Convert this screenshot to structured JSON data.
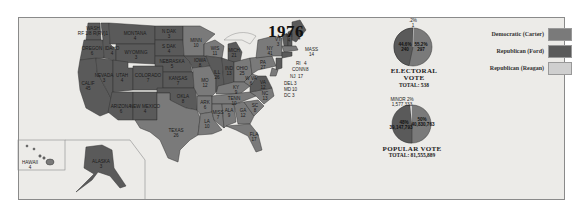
{
  "title": "1976",
  "colors": {
    "democratic_carter": "#7a7a7a",
    "republican_ford": "#5a5a5a",
    "republican_reagan": "#cfcfcf",
    "background": "#ecebe8",
    "border": "#8a8a8a"
  },
  "legend": [
    {
      "label": "Democratic (Carter)",
      "color": "#7a7a7a"
    },
    {
      "label": "Republican (Ford)",
      "color": "#5a5a5a"
    },
    {
      "label": "Republican (Reagan)",
      "color": "#cfcfcf"
    }
  ],
  "electoral_vote": {
    "caption": "ELECTORAL VOTE",
    "total_label": "TOTAL: 538",
    "slices": [
      {
        "party": "Republican (Ford)",
        "pct": "44.6%",
        "votes": "240"
      },
      {
        "party": "Democratic (Carter)",
        "pct": "55.2%",
        "votes": "297"
      },
      {
        "party": "Republican (Reagan)",
        "pct": ".2%",
        "votes": "1"
      }
    ]
  },
  "popular_vote": {
    "caption": "POPULAR VOTE",
    "total_label": "TOTAL: 81,555,889",
    "slices": [
      {
        "party": "Republican (Ford)",
        "pct": "48%",
        "votes": "39,147,793"
      },
      {
        "party": "Democratic (Carter)",
        "pct": "50%",
        "votes": "40,830,763"
      },
      {
        "party": "Minor",
        "pct": "MINOR 2%",
        "votes": "1,577,333"
      }
    ]
  },
  "states": [
    {
      "name": "WASH",
      "ev": "8",
      "extra": "RF 1/8 R(RV)1"
    },
    {
      "name": "OREGON",
      "ev": "6"
    },
    {
      "name": "CALIF",
      "ev": "45"
    },
    {
      "name": "NEVADA",
      "ev": "3"
    },
    {
      "name": "IDAHO",
      "ev": "4"
    },
    {
      "name": "MONTANA",
      "ev": "4"
    },
    {
      "name": "WYOMING",
      "ev": "3"
    },
    {
      "name": "UTAH",
      "ev": "4"
    },
    {
      "name": "COLORADO",
      "ev": "7"
    },
    {
      "name": "ARIZONA",
      "ev": "6"
    },
    {
      "name": "NEW MEXICO",
      "ev": "4"
    },
    {
      "name": "N DAK",
      "ev": "3"
    },
    {
      "name": "S DAK",
      "ev": "4"
    },
    {
      "name": "NEBRASKA",
      "ev": "5"
    },
    {
      "name": "KANSAS",
      "ev": "7"
    },
    {
      "name": "OKLA",
      "ev": "8"
    },
    {
      "name": "TEXAS",
      "ev": "26"
    },
    {
      "name": "MINN",
      "ev": "10"
    },
    {
      "name": "IOWA",
      "ev": "8"
    },
    {
      "name": "MO",
      "ev": "12"
    },
    {
      "name": "ARK",
      "ev": "6"
    },
    {
      "name": "LA",
      "ev": "10"
    },
    {
      "name": "WIS",
      "ev": "11"
    },
    {
      "name": "ILL",
      "ev": "26"
    },
    {
      "name": "MICH",
      "ev": "21"
    },
    {
      "name": "IND",
      "ev": "13"
    },
    {
      "name": "OHIO",
      "ev": "25"
    },
    {
      "name": "KY",
      "ev": "9"
    },
    {
      "name": "TENN",
      "ev": "10"
    },
    {
      "name": "MISS",
      "ev": "7"
    },
    {
      "name": "ALA",
      "ev": "9"
    },
    {
      "name": "GA",
      "ev": "12"
    },
    {
      "name": "FLA",
      "ev": "17"
    },
    {
      "name": "SC",
      "ev": "8"
    },
    {
      "name": "NC",
      "ev": "13"
    },
    {
      "name": "VA",
      "ev": "12"
    },
    {
      "name": "W VA",
      "ev": "6"
    },
    {
      "name": "PA",
      "ev": "27"
    },
    {
      "name": "NY",
      "ev": "41"
    },
    {
      "name": "VT",
      "ev": "3"
    },
    {
      "name": "NH",
      "ev": "4"
    },
    {
      "name": "ME",
      "ev": "4"
    },
    {
      "name": "MASS",
      "ev": "14"
    },
    {
      "name": "RI",
      "ev": "4"
    },
    {
      "name": "CONN",
      "ev": "8"
    },
    {
      "name": "NJ",
      "ev": "17"
    },
    {
      "name": "DEL",
      "ev": "3"
    },
    {
      "name": "MD",
      "ev": "10"
    },
    {
      "name": "DC",
      "ev": "3"
    },
    {
      "name": "HAWAII",
      "ev": "4"
    },
    {
      "name": "ALASKA",
      "ev": "3"
    }
  ]
}
